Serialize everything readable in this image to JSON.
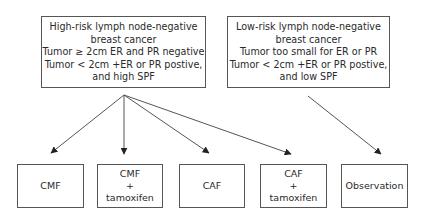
{
  "diagram": {
    "type": "flowchart",
    "top_boxes": [
      {
        "id": "high-risk",
        "lines": [
          "High-risk lymph node-negative",
          "breast cancer",
          "Tumor ≥ 2cm ER and PR negative",
          "Tumor < 2cm +ER or PR  postive,",
          "and high SPF"
        ]
      },
      {
        "id": "low-risk",
        "lines": [
          "Low-risk lymph node-negative",
          "breast cancer",
          "Tumor too small for ER or PR",
          "Tumor < 2cm +ER or PR postive,",
          "and low SPF"
        ]
      }
    ],
    "bottom_boxes": [
      {
        "id": "cmf",
        "lines": [
          "CMF"
        ]
      },
      {
        "id": "cmf-tamoxifen",
        "lines": [
          "CMF",
          "+",
          "tamoxifen"
        ]
      },
      {
        "id": "caf",
        "lines": [
          "CAF"
        ]
      },
      {
        "id": "caf-tamoxifen",
        "lines": [
          "CAF",
          "+",
          "tamoxifen"
        ]
      },
      {
        "id": "observation",
        "lines": [
          "Observation"
        ]
      }
    ],
    "edges": [
      {
        "from": "high-risk",
        "to": "cmf"
      },
      {
        "from": "high-risk",
        "to": "cmf-tamoxifen"
      },
      {
        "from": "high-risk",
        "to": "caf"
      },
      {
        "from": "high-risk",
        "to": "caf-tamoxifen"
      },
      {
        "from": "low-risk",
        "to": "observation"
      }
    ],
    "colors": {
      "line": "#555555",
      "text": "#2a2a2a",
      "background": "#ffffff"
    }
  }
}
